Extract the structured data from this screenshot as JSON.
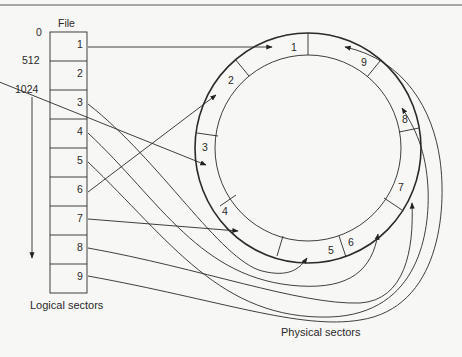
{
  "figure": {
    "file_label": "File",
    "offsets": [
      "0",
      "512",
      "1024"
    ],
    "logical_caption": "Logical sectors",
    "physical_caption": "Physical sectors",
    "logical_sectors": [
      "1",
      "2",
      "3",
      "4",
      "5",
      "6",
      "7",
      "8",
      "9"
    ],
    "physical_sectors_clockwise_from_top": [
      "1",
      "9",
      "8",
      "7",
      "6",
      "5",
      "4",
      "3",
      "2"
    ],
    "mapping_note": "Logical sectors interleaved onto physical sectors of a disk track"
  }
}
